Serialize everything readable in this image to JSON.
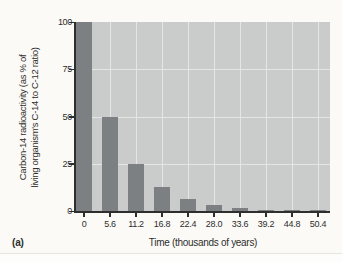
{
  "figure_label": "(a)",
  "chart_data": {
    "type": "bar",
    "title": "",
    "xlabel": "Time (thousands of years)",
    "ylabel_line1": "Carbon-14 radioactivity (as % of",
    "ylabel_line2": "living organism's C-14 to C-12 ratio)",
    "categories": [
      "0",
      "5.6",
      "11.2",
      "16.8",
      "22.4",
      "28.0",
      "33.6",
      "39.2",
      "44.8",
      "50.4"
    ],
    "values": [
      100,
      50,
      25,
      12.5,
      6.25,
      3.13,
      1.56,
      0.78,
      0.39,
      0.2
    ],
    "y_ticks": [
      0,
      25,
      50,
      75,
      100
    ],
    "ylim": [
      0,
      100
    ],
    "grid": true,
    "legend": "none",
    "colors": {
      "bar": "#7c8082",
      "plot_bg": "#c9ccca",
      "gridline": "#e4e6e3",
      "axis": "#2e2e2c",
      "text": "#2e2e2c",
      "page_bg": "#fbfaf7",
      "divider": "#e7e6e2",
      "bottom_strip": "#fdfdfc"
    }
  }
}
